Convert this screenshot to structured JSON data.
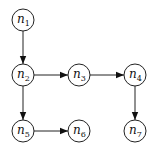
{
  "diagram": {
    "type": "directed-graph",
    "nodes": [
      {
        "id": "n1",
        "label": "n",
        "sub": "1",
        "x": 23,
        "y": 20
      },
      {
        "id": "n2",
        "label": "n",
        "sub": "2",
        "x": 23,
        "y": 75
      },
      {
        "id": "n3",
        "label": "n",
        "sub": "3",
        "x": 79,
        "y": 75
      },
      {
        "id": "n4",
        "label": "n",
        "sub": "4",
        "x": 135,
        "y": 75
      },
      {
        "id": "n5",
        "label": "n",
        "sub": "5",
        "x": 23,
        "y": 131
      },
      {
        "id": "n6",
        "label": "n",
        "sub": "6",
        "x": 79,
        "y": 131
      },
      {
        "id": "n7",
        "label": "n",
        "sub": "7",
        "x": 135,
        "y": 131
      }
    ],
    "edges": [
      {
        "from": "n1",
        "to": "n2"
      },
      {
        "from": "n2",
        "to": "n3"
      },
      {
        "from": "n3",
        "to": "n4"
      },
      {
        "from": "n2",
        "to": "n5"
      },
      {
        "from": "n5",
        "to": "n6"
      },
      {
        "from": "n4",
        "to": "n7"
      }
    ]
  }
}
